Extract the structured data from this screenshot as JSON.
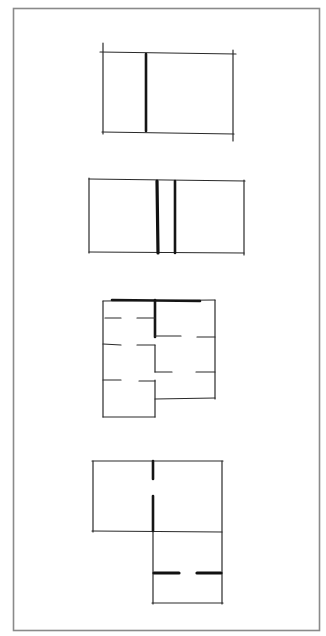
{
  "document": {
    "title": "Floor plan partition sketches",
    "sketch_count": 4
  },
  "sketches": [
    {
      "id": "sketch-1",
      "description": "Rectangle divided by one heavy vertical wall"
    },
    {
      "id": "sketch-2",
      "description": "Rectangle divided by two parallel heavy vertical walls forming a central strip"
    },
    {
      "id": "sketch-3",
      "description": "Stepped plan with a spine wall and dashed partial partitions forming rooms"
    },
    {
      "id": "sketch-4",
      "description": "L-shaped plan of two overlapping rectangles with wall openings"
    }
  ],
  "colors": {
    "ink": "#2a2a2a",
    "frame": "#8a8a8a",
    "paper": "#ffffff"
  }
}
